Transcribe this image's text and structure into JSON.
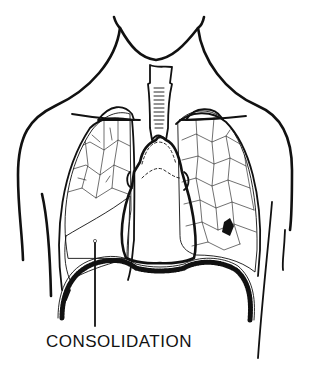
{
  "figure": {
    "colors": {
      "ink": "#111111",
      "background": "#ffffff",
      "consolidation_fill": "#161616"
    },
    "labels": {
      "consolidation": "CONSOLIDATION"
    },
    "parts": [
      "neck-outline",
      "shoulder-outline",
      "trachea",
      "right-lung",
      "left-lung",
      "heart",
      "diaphragm",
      "consolidated-region",
      "small-lesion",
      "leader-line"
    ]
  }
}
